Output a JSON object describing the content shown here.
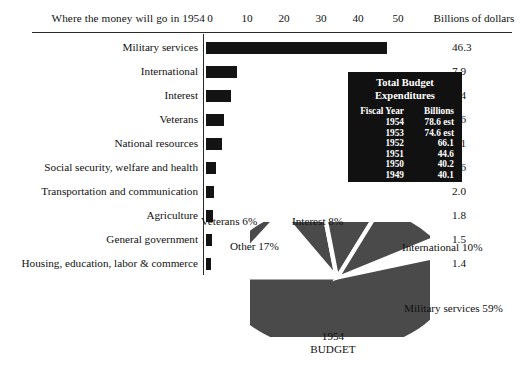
{
  "header": {
    "title": "Where the money will go in 1954",
    "unit_label": "Billions of dollars"
  },
  "chart_data": [
    {
      "type": "bar",
      "title": "Where the money will go in 1954",
      "xlabel": "Billions of dollars",
      "ylabel": "",
      "xlim": [
        0,
        55
      ],
      "grid": false,
      "orientation": "horizontal",
      "axis_ticks": [
        "0",
        "10",
        "20",
        "30",
        "40",
        "50"
      ],
      "axis_tick_values": [
        0,
        10,
        20,
        30,
        40,
        50
      ],
      "categories": [
        "Military services",
        "International",
        "Interest",
        "Veterans",
        "National resources",
        "Social security, welfare and health",
        "Transportation and communication",
        "Agriculture",
        "General government",
        "Housing, education, labor & commerce"
      ],
      "values": [
        46.3,
        7.9,
        6.4,
        4.6,
        4.1,
        2.6,
        2.0,
        1.8,
        1.5,
        1.4
      ],
      "value_labels": [
        "46.3",
        "7.9",
        "6.4",
        "4.6",
        "4.1",
        "2.6",
        "2.0",
        "1.8",
        "1.5",
        "1.4"
      ]
    },
    {
      "type": "pie",
      "title": "1954",
      "subtitle": "BUDGET",
      "labels": [
        "Military services",
        "International",
        "Interest",
        "Veterans",
        "Other"
      ],
      "values": [
        59,
        10,
        8,
        6,
        17
      ],
      "label_texts": [
        "Military services 59%",
        "International 10%",
        "Interest 8%",
        "Veterans 6%",
        "Other 17%"
      ],
      "legend": "outside-labels"
    }
  ],
  "inset_table": {
    "title_line1": "Total Budget",
    "title_line2": "Expenditures",
    "col_headers": [
      "Fiscal Year",
      "Billions"
    ],
    "rows": [
      {
        "year": "1954",
        "billions": "78.6 est"
      },
      {
        "year": "1953",
        "billions": "74.6 est"
      },
      {
        "year": "1952",
        "billions": "66.1"
      },
      {
        "year": "1951",
        "billions": "44.6"
      },
      {
        "year": "1950",
        "billions": "40.2"
      },
      {
        "year": "1949",
        "billions": "40.1"
      },
      {
        "year": "1945",
        "billions": "98.7"
      }
    ]
  },
  "pie_labels": {
    "veterans": "Veterans 6%",
    "interest": "Interest 8%",
    "other": "Other 17%",
    "international": "International 10%",
    "military": "Military services 59%",
    "caption_year": "1954",
    "caption_word": "BUDGET"
  },
  "colors": {
    "bar_fill": "#141414",
    "rule": "#2a2a2a",
    "inset_bg": "#111111",
    "inset_text": "#ffffff",
    "pie_fill": "#4a4a4a",
    "pie_divider": "#ffffff"
  }
}
